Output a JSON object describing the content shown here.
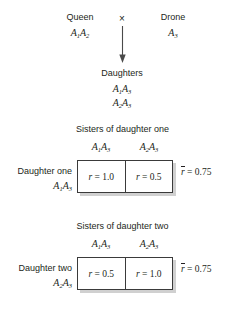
{
  "figure": {
    "cross": {
      "parent_left": {
        "label": "Queen",
        "genotype": "A1A2"
      },
      "operator": "×",
      "parent_right": {
        "label": "Drone",
        "genotype": "A3"
      },
      "offspring_label": "Daughters",
      "offspring_genotypes": [
        "A1A3",
        "A2A3"
      ]
    },
    "panels": [
      {
        "title": "Sisters of daughter one",
        "column_headers": [
          "A1A3",
          "A2A3"
        ],
        "row_label": "Daughter one",
        "row_genotype": "A1A3",
        "cells": [
          "r = 1.0",
          "r = 0.5"
        ],
        "mean_label": "r̄ = 0.75",
        "mean_value": 0.75
      },
      {
        "title": "Sisters of daughter two",
        "column_headers": [
          "A1A3",
          "A2A3"
        ],
        "row_label": "Daughter two",
        "row_genotype": "A2A3",
        "cells": [
          "r = 0.5",
          "r = 1.0"
        ],
        "mean_label": "r̄ = 0.75",
        "mean_value": 0.75
      }
    ],
    "colors": {
      "ink": "#231f20",
      "box_border": "#3a3a3a",
      "shadow": "#bdbdbd",
      "background": "#ffffff"
    }
  }
}
